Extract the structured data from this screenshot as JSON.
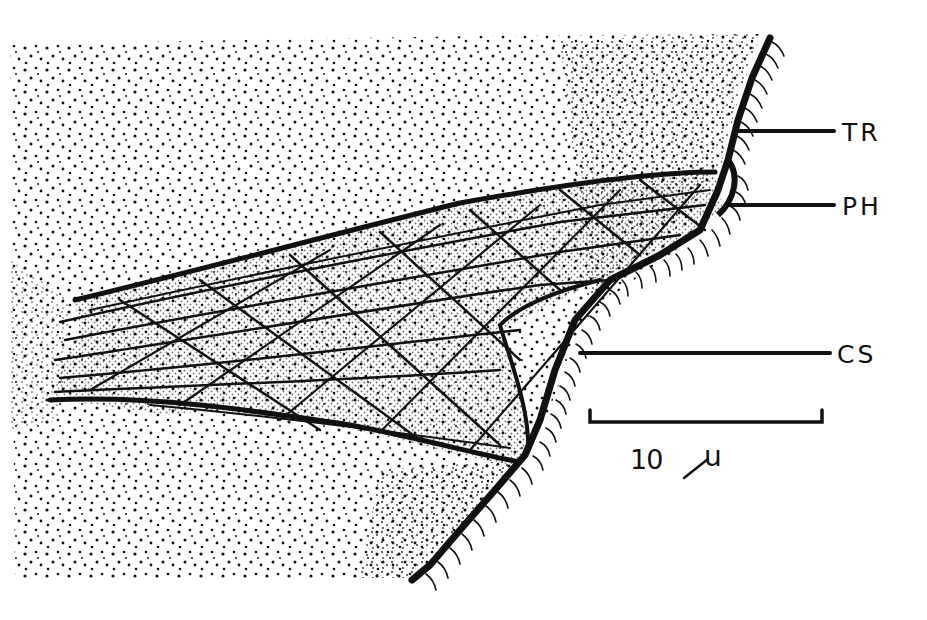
{
  "figure": {
    "type": "stippled biological illustration",
    "colors": {
      "ink": "#111111",
      "paper": "#ffffff"
    }
  },
  "labels": [
    {
      "id": "TR",
      "text": "TR",
      "leader_y": 131
    },
    {
      "id": "PH",
      "text": "PH",
      "leader_y": 205
    },
    {
      "id": "CS",
      "text": "CS",
      "leader_y": 353
    }
  ],
  "scale_bar": {
    "value": "10",
    "unit": "µ",
    "label": "10 µ"
  }
}
